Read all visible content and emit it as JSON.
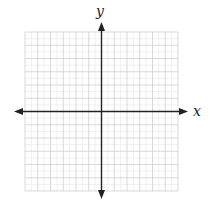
{
  "diagram": {
    "type": "cartesian-coordinate-grid",
    "x_axis_label": "x",
    "y_axis_label": "y",
    "grid": {
      "major_cells_x": 12,
      "major_cells_y": 12,
      "minor_subdivisions": 2,
      "units_per_side": 6
    },
    "colors": {
      "axis": "#222222",
      "major_grid": "#cfcfcf",
      "minor_grid": "#ececec",
      "background": "#ffffff"
    }
  }
}
